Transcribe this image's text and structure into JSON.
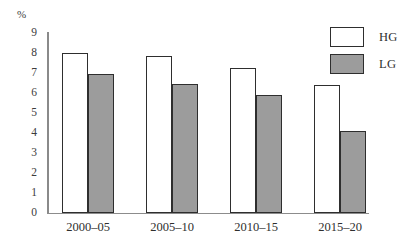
{
  "chart_data": {
    "type": "bar",
    "title": "",
    "subtitle": "",
    "xlabel": "",
    "ylabel": "%",
    "unit_label": "%",
    "categories": [
      "2000–05",
      "2005–10",
      "2010–15",
      "2015–20"
    ],
    "series": [
      {
        "name": "HG",
        "values": [
          8.0,
          7.85,
          7.25,
          6.4
        ],
        "color": "#ffffff",
        "border_color": "#2e2e2e"
      },
      {
        "name": "LG",
        "values": [
          6.95,
          6.45,
          5.9,
          4.1
        ],
        "color": "#9c9c9c",
        "border_color": "#2e2e2e"
      }
    ],
    "ylim": [
      0,
      9
    ],
    "ytick_labels": [
      "9",
      "8",
      "7",
      "6",
      "5",
      "4",
      "3",
      "2",
      "1",
      "0"
    ],
    "ytick_values": [
      9,
      8,
      7,
      6,
      5,
      4,
      3,
      2,
      1,
      0
    ],
    "grid": false,
    "legend_position": "top-right",
    "legend": [
      {
        "label": "HG",
        "swatch": "white-box"
      },
      {
        "label": "LG",
        "swatch": "gray-box"
      }
    ]
  },
  "axes": {
    "y_unit": "%",
    "y_tick_0": "9",
    "y_tick_1": "8",
    "y_tick_2": "7",
    "y_tick_3": "6",
    "y_tick_4": "5",
    "y_tick_5": "4",
    "y_tick_6": "3",
    "y_tick_7": "2",
    "y_tick_8": "1",
    "y_tick_9": "0"
  },
  "legend": {
    "hg_label": "HG",
    "lg_label": "LG"
  },
  "x_axis": {
    "cat_0": "2000–05",
    "cat_1": "2005–10",
    "cat_2": "2010–15",
    "cat_3": "2015–20"
  }
}
